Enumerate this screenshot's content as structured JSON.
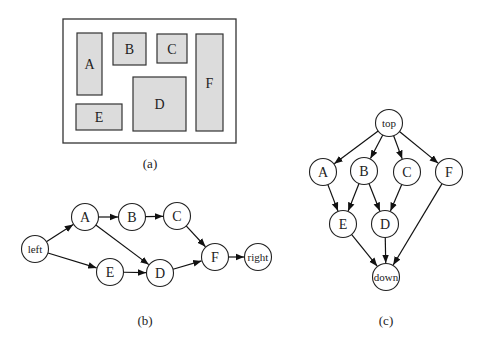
{
  "panel_a": {
    "caption": "(a)",
    "outer": {
      "x": 63,
      "y": 19,
      "w": 173,
      "h": 124
    },
    "blocks": [
      {
        "id": "A",
        "label": "A",
        "x": 77,
        "y": 33,
        "w": 25,
        "h": 62
      },
      {
        "id": "B",
        "label": "B",
        "x": 113,
        "y": 33,
        "w": 33,
        "h": 32
      },
      {
        "id": "C",
        "label": "C",
        "x": 157,
        "y": 34,
        "w": 30,
        "h": 29
      },
      {
        "id": "F",
        "label": "F",
        "x": 196,
        "y": 34,
        "w": 27,
        "h": 97
      },
      {
        "id": "D",
        "label": "D",
        "x": 133,
        "y": 77,
        "w": 53,
        "h": 54
      },
      {
        "id": "E",
        "label": "E",
        "x": 76,
        "y": 104,
        "w": 46,
        "h": 26
      }
    ],
    "fill_color": "#dcdcdc"
  },
  "panel_b": {
    "caption": "(b)",
    "nodes": [
      {
        "id": "left",
        "label": "left",
        "cx": 35,
        "cy": 249
      },
      {
        "id": "A",
        "label": "A",
        "cx": 85,
        "cy": 217
      },
      {
        "id": "B",
        "label": "B",
        "cx": 132,
        "cy": 217
      },
      {
        "id": "C",
        "label": "C",
        "cx": 177,
        "cy": 216
      },
      {
        "id": "E",
        "label": "E",
        "cx": 110,
        "cy": 272
      },
      {
        "id": "D",
        "label": "D",
        "cx": 160,
        "cy": 273
      },
      {
        "id": "F",
        "label": "F",
        "cx": 215,
        "cy": 257
      },
      {
        "id": "right",
        "label": "right",
        "cx": 258,
        "cy": 257
      }
    ],
    "edges": [
      [
        "left",
        "A"
      ],
      [
        "left",
        "E"
      ],
      [
        "A",
        "B"
      ],
      [
        "A",
        "D"
      ],
      [
        "B",
        "C"
      ],
      [
        "C",
        "F"
      ],
      [
        "E",
        "D"
      ],
      [
        "D",
        "F"
      ],
      [
        "F",
        "right"
      ]
    ]
  },
  "panel_c": {
    "caption": "(c)",
    "nodes": [
      {
        "id": "top",
        "label": "top",
        "cx": 389,
        "cy": 123
      },
      {
        "id": "A",
        "label": "A",
        "cx": 323,
        "cy": 172
      },
      {
        "id": "B",
        "label": "B",
        "cx": 364,
        "cy": 171
      },
      {
        "id": "C",
        "label": "C",
        "cx": 407,
        "cy": 172
      },
      {
        "id": "F",
        "label": "F",
        "cx": 449,
        "cy": 172
      },
      {
        "id": "E",
        "label": "E",
        "cx": 343,
        "cy": 224
      },
      {
        "id": "D",
        "label": "D",
        "cx": 385,
        "cy": 224
      },
      {
        "id": "down",
        "label": "down",
        "cx": 386,
        "cy": 277
      }
    ],
    "edges": [
      [
        "top",
        "A"
      ],
      [
        "top",
        "B"
      ],
      [
        "top",
        "C"
      ],
      [
        "top",
        "F"
      ],
      [
        "A",
        "E"
      ],
      [
        "B",
        "E"
      ],
      [
        "B",
        "D"
      ],
      [
        "C",
        "D"
      ],
      [
        "E",
        "down"
      ],
      [
        "D",
        "down"
      ],
      [
        "F",
        "down"
      ]
    ]
  },
  "node_radius": 13.5,
  "captions": {
    "a": "(a)",
    "b": "(b)",
    "c": "(c)"
  }
}
